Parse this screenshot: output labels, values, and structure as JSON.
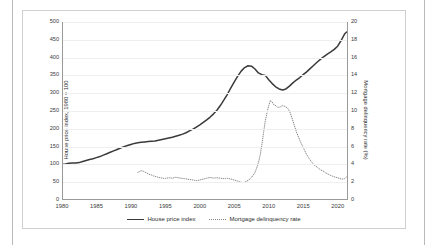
{
  "chart_data": {
    "type": "line",
    "title": "",
    "xlabel": "",
    "ylabel": "House price index, 1980 = 100",
    "ylabel_secondary": "Mortgage delinquency rate (%)",
    "grid": true,
    "legend_position": "bottom",
    "xlim": [
      1980,
      2021.5
    ],
    "ylim": [
      0,
      500
    ],
    "ylim_secondary": [
      0,
      20
    ],
    "xticks": [
      1980,
      1985,
      1990,
      1995,
      2000,
      2005,
      2010,
      2015,
      2020
    ],
    "yticks": [
      0,
      50,
      100,
      150,
      200,
      250,
      300,
      350,
      400,
      450,
      500
    ],
    "yticks_secondary": [
      0,
      2,
      4,
      6,
      8,
      10,
      12,
      14,
      16,
      18,
      20
    ],
    "series": [
      {
        "name": "House price index",
        "axis": "left",
        "style": "solid",
        "color": "#3a3a3a",
        "x": [
          1980,
          1980.5,
          1981,
          1981.5,
          1982,
          1982.5,
          1983,
          1983.5,
          1984,
          1984.5,
          1985,
          1985.5,
          1986,
          1986.5,
          1987,
          1987.5,
          1988,
          1988.5,
          1989,
          1989.5,
          1990,
          1990.5,
          1991,
          1991.5,
          1992,
          1992.5,
          1993,
          1993.5,
          1994,
          1994.5,
          1995,
          1995.5,
          1996,
          1996.5,
          1997,
          1997.5,
          1998,
          1998.5,
          1999,
          1999.5,
          2000,
          2000.5,
          2001,
          2001.5,
          2002,
          2002.5,
          2003,
          2003.5,
          2004,
          2004.5,
          2005,
          2005.5,
          2006,
          2006.5,
          2007,
          2007.5,
          2008,
          2008.5,
          2009,
          2009.5,
          2010,
          2010.5,
          2011,
          2011.5,
          2012,
          2012.5,
          2013,
          2013.5,
          2014,
          2014.5,
          2015,
          2015.5,
          2016,
          2016.5,
          2017,
          2017.5,
          2018,
          2018.5,
          2019,
          2019.5,
          2020,
          2020.5,
          2021,
          2021.3
        ],
        "y": [
          100,
          101,
          103,
          104,
          104,
          105,
          108,
          111,
          114,
          116,
          119,
          122,
          126,
          130,
          134,
          138,
          142,
          146,
          150,
          153,
          156,
          159,
          161,
          162,
          163,
          164,
          165,
          166,
          168,
          170,
          172,
          174,
          176,
          179,
          182,
          185,
          189,
          194,
          199,
          205,
          211,
          218,
          225,
          233,
          242,
          253,
          266,
          281,
          297,
          315,
          332,
          348,
          362,
          372,
          377,
          376,
          368,
          357,
          352,
          350,
          338,
          327,
          318,
          312,
          309,
          312,
          320,
          329,
          337,
          344,
          352,
          360,
          369,
          378,
          387,
          395,
          403,
          410,
          416,
          423,
          432,
          448,
          466,
          472
        ]
      },
      {
        "name": "Mortgage delinquency rate",
        "axis": "right",
        "style": "dotted",
        "color": "#8a8a8a",
        "x": [
          1991,
          1991.25,
          1991.5,
          1991.75,
          1992,
          1992.25,
          1992.5,
          1992.75,
          1993,
          1993.25,
          1993.5,
          1993.75,
          1994,
          1994.25,
          1994.5,
          1994.75,
          1995,
          1995.25,
          1995.5,
          1995.75,
          1996,
          1996.25,
          1996.5,
          1996.75,
          1997,
          1997.25,
          1997.5,
          1997.75,
          1998,
          1998.25,
          1998.5,
          1998.75,
          1999,
          1999.25,
          1999.5,
          1999.75,
          2000,
          2000.25,
          2000.5,
          2000.75,
          2001,
          2001.25,
          2001.5,
          2001.75,
          2002,
          2002.25,
          2002.5,
          2002.75,
          2003,
          2003.25,
          2003.5,
          2003.75,
          2004,
          2004.25,
          2004.5,
          2004.75,
          2005,
          2005.25,
          2005.5,
          2005.75,
          2006,
          2006.25,
          2006.5,
          2006.75,
          2007,
          2007.25,
          2007.5,
          2007.75,
          2008,
          2008.25,
          2008.5,
          2008.75,
          2009,
          2009.25,
          2009.5,
          2009.75,
          2010,
          2010.25,
          2010.5,
          2010.75,
          2011,
          2011.25,
          2011.5,
          2011.75,
          2012,
          2012.25,
          2012.5,
          2012.75,
          2013,
          2013.25,
          2013.5,
          2013.75,
          2014,
          2014.25,
          2014.5,
          2014.75,
          2015,
          2015.25,
          2015.5,
          2015.75,
          2016,
          2016.25,
          2016.5,
          2016.75,
          2017,
          2017.25,
          2017.5,
          2017.75,
          2018,
          2018.25,
          2018.5,
          2018.75,
          2019,
          2019.25,
          2019.5,
          2019.75,
          2020,
          2020.25,
          2020.5,
          2020.75,
          2021,
          2021.3
        ],
        "y": [
          3.1,
          3.2,
          3.3,
          3.25,
          3.15,
          3.05,
          2.95,
          2.85,
          2.8,
          2.72,
          2.66,
          2.6,
          2.54,
          2.5,
          2.46,
          2.44,
          2.42,
          2.46,
          2.5,
          2.48,
          2.45,
          2.5,
          2.55,
          2.52,
          2.48,
          2.45,
          2.42,
          2.4,
          2.38,
          2.34,
          2.3,
          2.28,
          2.25,
          2.2,
          2.18,
          2.2,
          2.25,
          2.3,
          2.35,
          2.4,
          2.45,
          2.5,
          2.52,
          2.5,
          2.46,
          2.48,
          2.5,
          2.48,
          2.45,
          2.42,
          2.4,
          2.42,
          2.44,
          2.4,
          2.36,
          2.3,
          2.24,
          2.18,
          2.12,
          2.06,
          2.0,
          1.95,
          2.0,
          2.1,
          2.2,
          2.35,
          2.55,
          2.8,
          3.1,
          3.6,
          4.2,
          5.0,
          6.2,
          7.6,
          8.9,
          9.8,
          10.6,
          11.2,
          11.0,
          10.7,
          10.6,
          10.45,
          10.4,
          10.5,
          10.6,
          10.55,
          10.45,
          10.3,
          10.0,
          9.5,
          8.9,
          8.3,
          7.7,
          7.2,
          6.7,
          6.3,
          5.9,
          5.5,
          5.1,
          4.8,
          4.5,
          4.25,
          4.0,
          3.85,
          3.7,
          3.55,
          3.4,
          3.3,
          3.2,
          3.05,
          2.95,
          2.85,
          2.75,
          2.68,
          2.6,
          2.55,
          2.5,
          2.42,
          2.38,
          2.35,
          2.4,
          2.6
        ]
      }
    ]
  },
  "legend": {
    "items": [
      {
        "label": "House price index"
      },
      {
        "label": "Mortgage delinquency rate"
      }
    ]
  }
}
